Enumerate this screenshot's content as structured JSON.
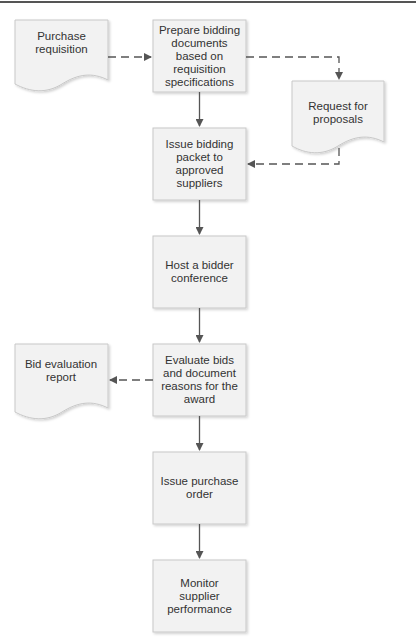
{
  "diagram": {
    "type": "flowchart",
    "colors": {
      "box_fill": "#f2f2f2",
      "box_stroke": "#c8c8c8",
      "arrow": "#555555",
      "text": "#333333"
    },
    "documents": [
      {
        "id": "purchase-requisition",
        "label": "Purchase requisition"
      },
      {
        "id": "request-for-proposals",
        "label": "Request for proposals"
      },
      {
        "id": "bid-evaluation-report",
        "label": "Bid evaluation report"
      }
    ],
    "steps": [
      {
        "id": "prepare",
        "label": "Prepare bidding documents based on requisition specifications"
      },
      {
        "id": "issue-packet",
        "label": "Issue bidding packet to approved suppliers"
      },
      {
        "id": "host-conference",
        "label": "Host a bidder conference"
      },
      {
        "id": "evaluate",
        "label": "Evaluate bids and document reasons for the award"
      },
      {
        "id": "issue-po",
        "label": "Issue purchase order"
      },
      {
        "id": "monitor",
        "label": "Monitor supplier performance"
      }
    ],
    "edges": [
      {
        "from": "purchase-requisition",
        "to": "prepare",
        "style": "dashed"
      },
      {
        "from": "prepare",
        "to": "request-for-proposals",
        "style": "dashed"
      },
      {
        "from": "request-for-proposals",
        "to": "issue-packet",
        "style": "dashed"
      },
      {
        "from": "prepare",
        "to": "issue-packet",
        "style": "solid"
      },
      {
        "from": "issue-packet",
        "to": "host-conference",
        "style": "solid"
      },
      {
        "from": "host-conference",
        "to": "evaluate",
        "style": "solid"
      },
      {
        "from": "evaluate",
        "to": "bid-evaluation-report",
        "style": "dashed"
      },
      {
        "from": "evaluate",
        "to": "issue-po",
        "style": "solid"
      },
      {
        "from": "issue-po",
        "to": "monitor",
        "style": "solid"
      }
    ]
  }
}
